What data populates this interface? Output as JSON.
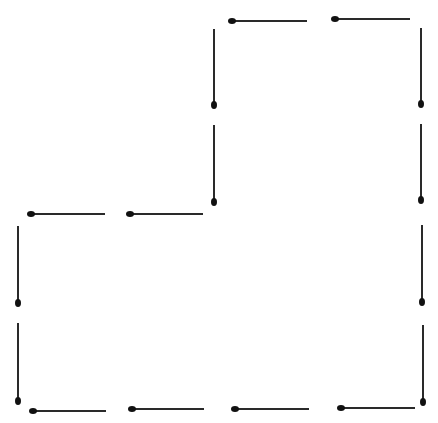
{
  "diagram": {
    "colors": {
      "background": "#ffffff",
      "stick": "#2a2a2a",
      "head": "#111111"
    },
    "matches": [
      {
        "id": "top-1",
        "orient": "h",
        "x1": 232,
        "y1": 21,
        "x2": 307,
        "head": "left",
        "w": 1.6
      },
      {
        "id": "top-2",
        "orient": "h",
        "x1": 335,
        "y1": 19,
        "x2": 410,
        "head": "left",
        "w": 1.6
      },
      {
        "id": "inner-v-1",
        "orient": "v",
        "x": 214,
        "y1": 29,
        "y2": 105,
        "head": "bottom",
        "w": 2.4
      },
      {
        "id": "inner-v-2",
        "orient": "v",
        "x": 214,
        "y1": 125,
        "y2": 202,
        "head": "bottom",
        "w": 2.4
      },
      {
        "id": "mid-1",
        "orient": "h",
        "x1": 31,
        "y1": 214,
        "x2": 105,
        "head": "left",
        "w": 2.4
      },
      {
        "id": "mid-2",
        "orient": "h",
        "x1": 130,
        "y1": 214,
        "x2": 203,
        "head": "left",
        "w": 2.4
      },
      {
        "id": "right-v-1",
        "orient": "v",
        "x": 421,
        "y1": 28,
        "y2": 104,
        "head": "bottom",
        "w": 2.2
      },
      {
        "id": "right-v-2",
        "orient": "v",
        "x": 421,
        "y1": 124,
        "y2": 200,
        "head": "bottom",
        "w": 2.2
      },
      {
        "id": "right-v-3",
        "orient": "v",
        "x": 422,
        "y1": 225,
        "y2": 302,
        "head": "bottom",
        "w": 2.0
      },
      {
        "id": "right-v-4",
        "orient": "v",
        "x": 423,
        "y1": 325,
        "y2": 402,
        "head": "bottom",
        "w": 2.0
      },
      {
        "id": "left-v-1",
        "orient": "v",
        "x": 18,
        "y1": 226,
        "y2": 303,
        "head": "bottom",
        "w": 2.4
      },
      {
        "id": "left-v-2",
        "orient": "v",
        "x": 18,
        "y1": 323,
        "y2": 401,
        "head": "bottom",
        "w": 2.4
      },
      {
        "id": "bottom-1",
        "orient": "h",
        "x1": 33,
        "y1": 411,
        "x2": 106,
        "head": "left",
        "w": 1.6
      },
      {
        "id": "bottom-2",
        "orient": "h",
        "x1": 132,
        "y1": 409,
        "x2": 204,
        "head": "left",
        "w": 1.6
      },
      {
        "id": "bottom-3",
        "orient": "h",
        "x1": 235,
        "y1": 409,
        "x2": 309,
        "head": "left",
        "w": 1.6
      },
      {
        "id": "bottom-4",
        "orient": "h",
        "x1": 341,
        "y1": 408,
        "x2": 415,
        "head": "left",
        "w": 1.6
      }
    ]
  }
}
